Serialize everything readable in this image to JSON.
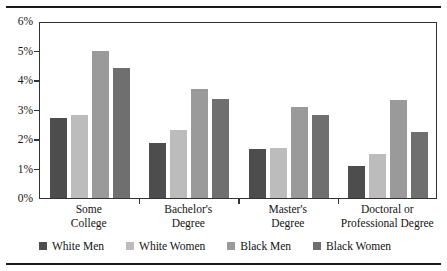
{
  "figure": {
    "has_top_rule": true,
    "has_bottom_rule": true,
    "rule_color": "#1a1a1a",
    "background": "#ffffff"
  },
  "chart_data": {
    "type": "bar",
    "title": "",
    "subtitle": "",
    "xlabel": "",
    "ylabel": "",
    "categories": [
      "Some College",
      "Bachelor's Degree",
      "Master's Degree",
      "Doctoral or Professional Degree"
    ],
    "category_lines": [
      [
        "Some",
        "College"
      ],
      [
        "Bachelor's",
        "Degree"
      ],
      [
        "Master's",
        "Degree"
      ],
      [
        "Doctoral or",
        "Professional Degree"
      ]
    ],
    "series": [
      {
        "name": "White Men",
        "color": "#4d4d4d",
        "values": [
          2.7,
          1.85,
          1.65,
          1.1
        ]
      },
      {
        "name": "White Women",
        "color": "#bcbcbc",
        "values": [
          2.8,
          2.3,
          1.7,
          1.5
        ]
      },
      {
        "name": "Black Men",
        "color": "#9a9a9a",
        "values": [
          5.0,
          3.68,
          3.07,
          3.32
        ]
      },
      {
        "name": "Black Women",
        "color": "#6f6f6f",
        "values": [
          4.4,
          3.35,
          2.83,
          2.25
        ]
      }
    ],
    "ylim": [
      0,
      6
    ],
    "yticks": [
      0,
      1,
      2,
      3,
      4,
      5,
      6
    ],
    "ytick_labels": [
      "0%",
      "1%",
      "2%",
      "3%",
      "4%",
      "5%",
      "6%"
    ],
    "grid": false,
    "legend_position": "bottom",
    "value_unit": "%"
  },
  "legend": {
    "items": [
      {
        "label": "White Men",
        "color": "#4d4d4d"
      },
      {
        "label": "White Women",
        "color": "#bcbcbc"
      },
      {
        "label": "Black Men",
        "color": "#9a9a9a"
      },
      {
        "label": "Black Women",
        "color": "#6f6f6f"
      }
    ]
  }
}
